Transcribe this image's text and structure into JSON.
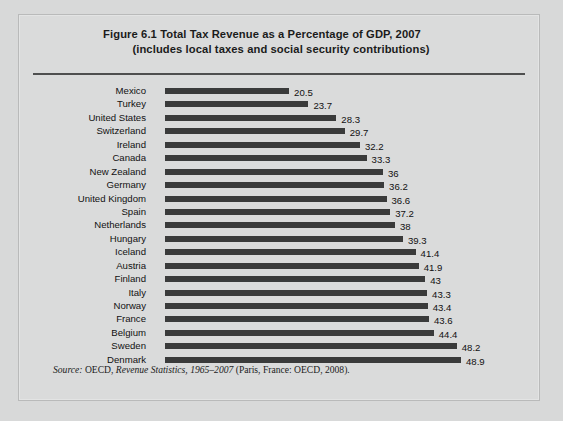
{
  "figure": {
    "title_line_1": "Figure 6.1  Total Tax Revenue as a Percentage of GDP, 2007",
    "title_line_2": "(includes local taxes and social security contributions)",
    "source_label": "Source:",
    "source_publisher": " OECD, ",
    "source_title": "Revenue Statistics, 1965–2007",
    "source_rest": " (Paris, France: OECD, 2008)."
  },
  "colors": {
    "page_background": "#d8d9d9",
    "panel_background": "#dadbdb",
    "panel_border": "#b9baba",
    "bar_fill": "#3a3b3b",
    "rule": "#4e4f4f",
    "text": "#111111"
  },
  "chart_data": {
    "type": "bar",
    "orientation": "horizontal",
    "title": "Figure 6.1  Total Tax Revenue as a Percentage of GDP, 2007 (includes local taxes and social security contributions)",
    "xlabel": "",
    "ylabel": "",
    "xlim": [
      0,
      48.9
    ],
    "grid": false,
    "legend": false,
    "axis_ticks_shown": false,
    "data_labels_shown": true,
    "categories": [
      "Mexico",
      "Turkey",
      "United States",
      "Switzerland",
      "Ireland",
      "Canada",
      "New Zealand",
      "Germany",
      "United Kingdom",
      "Spain",
      "Netherlands",
      "Hungary",
      "Iceland",
      "Austria",
      "Finland",
      "Italy",
      "Norway",
      "France",
      "Belgium",
      "Sweden",
      "Denmark"
    ],
    "values": [
      20.5,
      23.7,
      28.3,
      29.7,
      32.2,
      33.3,
      36,
      36.2,
      36.6,
      37.2,
      38,
      39.3,
      41.4,
      41.9,
      43,
      43.3,
      43.4,
      43.6,
      44.4,
      48.2,
      48.9
    ],
    "value_labels": [
      "20.5",
      "23.7",
      "28.3",
      "29.7",
      "32.2",
      "33.3",
      "36",
      "36.2",
      "36.6",
      "37.2",
      "38",
      "39.3",
      "41.4",
      "41.9",
      "43",
      "43.3",
      "43.4",
      "43.6",
      "44.4",
      "48.2",
      "48.9"
    ]
  }
}
